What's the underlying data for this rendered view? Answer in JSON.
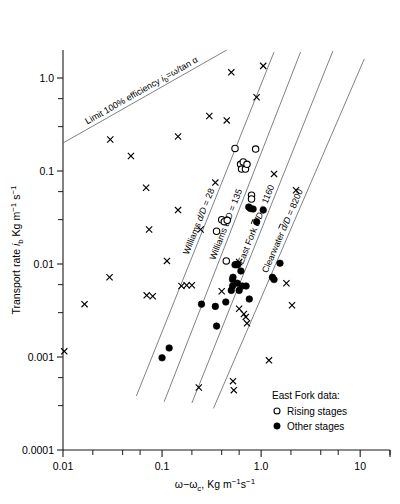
{
  "chart_data": {
    "type": "scatter",
    "title": "",
    "xlabel": "ω−ωc, Kg m⁻¹s⁻¹",
    "ylabel": "Transport rate ib Kg m⁻¹ s⁻¹",
    "xscale": "log",
    "yscale": "log",
    "xlim": [
      0.01,
      20
    ],
    "ylim": [
      0.0001,
      2.0
    ],
    "grid": false,
    "xticks": [
      0.01,
      0.1,
      1.0,
      10
    ],
    "xticklabels": [
      "0.01",
      "0.1",
      "1.0",
      "10"
    ],
    "yticks": [
      1.0,
      0.1,
      0.01,
      0.001,
      0.0001
    ],
    "yticklabels": [
      "1.0",
      "0.1",
      "0.01",
      "0.001",
      "0.0001"
    ],
    "legend": {
      "position": "lower-right",
      "title": "East Fork data:",
      "entries": [
        {
          "marker": "open-circle",
          "label": "Rising stages"
        },
        {
          "marker": "filled-circle",
          "label": "Other stages"
        }
      ]
    },
    "reference_lines": [
      {
        "name": "limit-100-efficiency",
        "label": "Limit 100% efficiency",
        "equation": "ib=ω/tan α",
        "x1": 0.01,
        "y1": 0.2,
        "x2": 0.45,
        "y2": 2.0
      },
      {
        "name": "williams-28",
        "label": "Williams d/D = 28",
        "dD": 28,
        "x1": 0.055,
        "y1": 0.00038,
        "x2": 1.35,
        "y2": 1.9
      },
      {
        "name": "williams-135",
        "label": "Williams d/D = 135",
        "dD": 135,
        "x1": 0.105,
        "y1": 0.00033,
        "x2": 2.5,
        "y2": 1.9
      },
      {
        "name": "east-fork-1160",
        "label": "East Fork d/D = 1160",
        "dD": 1160,
        "x1": 0.2,
        "y1": 0.00032,
        "x2": 5.3,
        "y2": 1.95
      },
      {
        "name": "clearwater-8200",
        "label": "Clearwater d/D = 8200",
        "dD": 8200,
        "x1": 0.33,
        "y1": 0.00028,
        "x2": 11.0,
        "y2": 1.6
      }
    ],
    "series": [
      {
        "name": "Other data (x symbols)",
        "marker": "x",
        "points": [
          [
            0.0103,
            0.00115
          ],
          [
            0.0165,
            0.0037
          ],
          [
            0.0295,
            0.0072
          ],
          [
            0.03,
            0.218
          ],
          [
            0.0485,
            0.145
          ],
          [
            0.069,
            0.066
          ],
          [
            0.074,
            0.0235
          ],
          [
            0.07,
            0.0046
          ],
          [
            0.0805,
            0.0045
          ],
          [
            0.112,
            0.0108
          ],
          [
            0.145,
            0.235
          ],
          [
            0.145,
            0.038
          ],
          [
            0.157,
            0.0058
          ],
          [
            0.177,
            0.0059
          ],
          [
            0.2,
            0.0059
          ],
          [
            0.245,
            0.0235
          ],
          [
            0.3,
            0.39
          ],
          [
            0.345,
            0.075
          ],
          [
            0.4,
            0.0051
          ],
          [
            0.45,
            0.35
          ],
          [
            0.5,
            1.15
          ],
          [
            0.52,
            0.00055
          ],
          [
            0.53,
            0.00044
          ],
          [
            0.6,
            0.0033
          ],
          [
            0.67,
            0.0029
          ],
          [
            0.7,
            0.0027
          ],
          [
            0.72,
            0.0023
          ],
          [
            0.9,
            0.62
          ],
          [
            1.05,
            1.35
          ],
          [
            1.2,
            0.00092
          ],
          [
            1.35,
            0.093
          ],
          [
            1.8,
            0.0062
          ],
          [
            2.05,
            0.0036
          ],
          [
            2.25,
            0.062
          ],
          [
            0.235,
            0.00047
          ],
          [
            0.6,
            0.0105
          ]
        ]
      },
      {
        "name": "East Fork rising stages",
        "marker": "open-circle",
        "points": [
          [
            0.4,
            0.03
          ],
          [
            0.425,
            0.0285
          ],
          [
            0.455,
            0.0295
          ],
          [
            0.355,
            0.0225
          ],
          [
            0.445,
            0.0108
          ],
          [
            0.545,
            0.175
          ],
          [
            0.62,
            0.118
          ],
          [
            0.635,
            0.105
          ],
          [
            0.66,
            0.125
          ],
          [
            0.695,
            0.105
          ],
          [
            0.72,
            0.118
          ],
          [
            0.88,
            0.172
          ],
          [
            0.8,
            0.055
          ],
          [
            0.8,
            0.05
          ]
        ]
      },
      {
        "name": "East Fork other stages",
        "marker": "filled-circle",
        "points": [
          [
            0.1,
            0.00098
          ],
          [
            0.118,
            0.00125
          ],
          [
            0.25,
            0.0037
          ],
          [
            0.345,
            0.0035
          ],
          [
            0.355,
            0.00215
          ],
          [
            0.44,
            0.0039
          ],
          [
            0.5,
            0.0052
          ],
          [
            0.515,
            0.0068
          ],
          [
            0.515,
            0.0058
          ],
          [
            0.52,
            0.0072
          ],
          [
            0.545,
            0.0098
          ],
          [
            0.575,
            0.0062
          ],
          [
            0.6,
            0.0052
          ],
          [
            0.625,
            0.0084
          ],
          [
            0.645,
            0.0058
          ],
          [
            0.705,
            0.0058
          ],
          [
            0.75,
            0.041
          ],
          [
            0.76,
            0.0042
          ],
          [
            0.78,
            0.0395
          ],
          [
            0.83,
            0.039
          ],
          [
            0.9,
            0.0285
          ],
          [
            1.05,
            0.038
          ],
          [
            1.3,
            0.0072
          ],
          [
            1.35,
            0.0068
          ],
          [
            1.55,
            0.0102
          ],
          [
            0.56,
            0.0099
          ],
          [
            0.58,
            0.0098
          ]
        ]
      }
    ]
  }
}
